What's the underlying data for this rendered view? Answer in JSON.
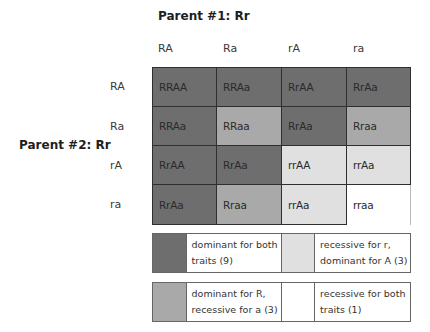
{
  "parent1": {
    "label": "Parent #1: Rr",
    "gametes": [
      "RA",
      "Ra",
      "rA",
      "ra"
    ]
  },
  "parent2": {
    "label": "Parent #2: Rr",
    "gametes": [
      "RA",
      "Ra",
      "rA",
      "ra"
    ]
  },
  "colors": {
    "dominant_both": "#6e6e6e",
    "dominant_R_recessive_a": "#a9a9a9",
    "recessive_r_dominant_A": "#e0e0e0",
    "recessive_both": "#ffffff"
  },
  "grid": {
    "rows": [
      [
        {
          "g": "RRAA",
          "t": "dominant_both"
        },
        {
          "g": "RRAa",
          "t": "dominant_both"
        },
        {
          "g": "RrAA",
          "t": "dominant_both"
        },
        {
          "g": "RrAa",
          "t": "dominant_both"
        }
      ],
      [
        {
          "g": "RRAa",
          "t": "dominant_both"
        },
        {
          "g": "RRaa",
          "t": "dominant_R_recessive_a"
        },
        {
          "g": "RrAa",
          "t": "dominant_both"
        },
        {
          "g": "Rraa",
          "t": "dominant_R_recessive_a"
        }
      ],
      [
        {
          "g": "RrAA",
          "t": "dominant_both"
        },
        {
          "g": "RrAa",
          "t": "dominant_both"
        },
        {
          "g": "rrAA",
          "t": "recessive_r_dominant_A"
        },
        {
          "g": "rrAa",
          "t": "recessive_r_dominant_A"
        }
      ],
      [
        {
          "g": "RrAa",
          "t": "dominant_both"
        },
        {
          "g": "Rraa",
          "t": "dominant_R_recessive_a"
        },
        {
          "g": "rrAa",
          "t": "recessive_r_dominant_A"
        },
        {
          "g": "rraa",
          "t": "recessive_both"
        }
      ]
    ]
  },
  "legend": {
    "dominant_both": "dominant for both traits (9)",
    "recessive_r_dominant_A": "recessive for r, dominant for A (3)",
    "dominant_R_recessive_a": "dominant for R, recessive for a (3)",
    "recessive_both": "recessive for both traits (1)"
  }
}
